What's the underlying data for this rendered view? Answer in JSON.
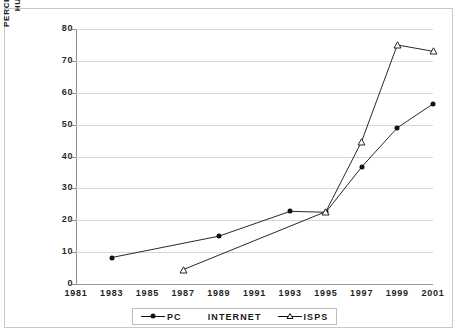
{
  "chart_data": {
    "type": "line",
    "title": "",
    "xlabel": "",
    "ylabel": "PERCENT OF HOUSEHOLD/ HUNDREDS OF ISPS",
    "ylabel_line1": "PERCENT OF HOUSEHOLD/",
    "ylabel_line2": "HUNDREDS OF ISPS",
    "xlim": [
      1981,
      2001
    ],
    "ylim": [
      0,
      80
    ],
    "ytick_step": 10,
    "grid": true,
    "legend_position": "bottom",
    "categories": [
      "1981",
      "1983",
      "1985",
      "1987",
      "1989",
      "1991",
      "1993",
      "1995",
      "1997",
      "1999",
      "2001"
    ],
    "yticks": [
      "0",
      "10",
      "20",
      "30",
      "40",
      "50",
      "60",
      "70",
      "80"
    ],
    "series": [
      {
        "name": "PC",
        "marker": "filled-diamond",
        "x": [
          1983,
          1989,
          1993,
          1995,
          1997,
          1999,
          2001
        ],
        "values": [
          8.3,
          15.0,
          22.8,
          22.5,
          36.7,
          49.0,
          56.5
        ]
      },
      {
        "name": "ISPS",
        "marker": "open-triangle",
        "x": [
          1987,
          1995,
          1997,
          1999,
          2001
        ],
        "values": [
          4.5,
          22.7,
          44.7,
          75.0,
          73.0
        ]
      }
    ],
    "legend_entries": [
      {
        "label": "PC",
        "marker": "filled-diamond"
      },
      {
        "label": "INTERNET",
        "marker": "none"
      },
      {
        "label": "ISPS",
        "marker": "open-triangle"
      }
    ],
    "colors": {
      "series_line": "#111111",
      "gridline": "#d7d7d7",
      "axis": "#8c8c8c",
      "text": "#1a1a1a",
      "background": "#ffffff",
      "border": "#c9c9c9"
    }
  }
}
